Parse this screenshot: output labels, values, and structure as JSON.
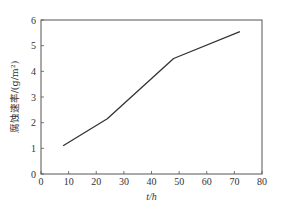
{
  "chart_data": {
    "type": "line",
    "title": "",
    "xlabel": "t/h",
    "ylabel": "腐蚀速率/(g/m²)",
    "xlim": [
      0,
      80
    ],
    "ylim": [
      0,
      6
    ],
    "xticks": [
      0,
      10,
      20,
      30,
      40,
      50,
      60,
      70,
      80
    ],
    "yticks": [
      0,
      1,
      2,
      3,
      4,
      5,
      6
    ],
    "grid": false,
    "legend": null,
    "series": [
      {
        "name": "corrosion rate",
        "x": [
          8,
          24,
          48,
          72
        ],
        "y": [
          1.1,
          2.15,
          4.5,
          5.55
        ]
      }
    ]
  },
  "colors": {
    "line": "#333333",
    "axis": "#555555"
  }
}
